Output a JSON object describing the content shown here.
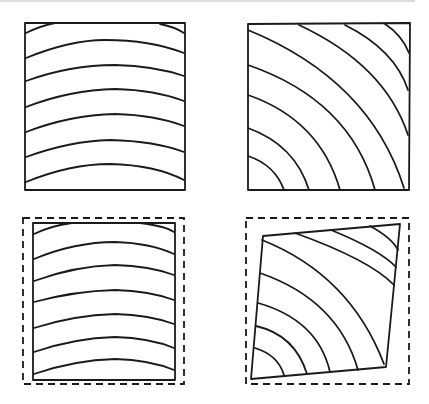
{
  "figure": {
    "ink_color": "#1a1a1a",
    "background": "#ffffff",
    "panels": [
      {
        "id": "flat-sawn-original",
        "position": "top-left",
        "grain": "horizontal-arcs",
        "arc_count": 7,
        "outline": "solid"
      },
      {
        "id": "quarter-sawn-original",
        "position": "top-right",
        "grain": "diagonal-concentric-arcs",
        "arc_count": 8,
        "outline": "solid"
      },
      {
        "id": "flat-sawn-shrunk",
        "position": "bottom-left",
        "grain": "horizontal-arcs",
        "arc_count": 7,
        "outline": "solid-inside-dashed-original"
      },
      {
        "id": "diagonal-shrunk",
        "position": "bottom-right",
        "grain": "diagonal-concentric-arcs",
        "arc_count": 8,
        "outline": "distorted-quad-inside-dashed-original"
      }
    ]
  }
}
